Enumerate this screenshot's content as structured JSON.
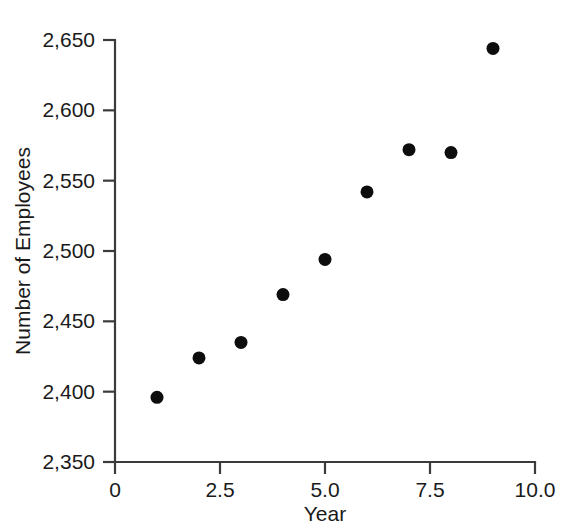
{
  "chart_data": {
    "type": "scatter",
    "title": "",
    "xlabel": "Year",
    "ylabel": "Number of Employees",
    "xlim": [
      0,
      10
    ],
    "ylim": [
      2350,
      2650
    ],
    "grid": false,
    "legend": false,
    "marker": {
      "shape": "filled-circle",
      "color": "#0d0d0d",
      "size_px": 13
    },
    "x_ticks": [
      {
        "value": 0,
        "label": "0"
      },
      {
        "value": 2.5,
        "label": "2.5"
      },
      {
        "value": 5,
        "label": "5.0"
      },
      {
        "value": 7.5,
        "label": "7.5"
      },
      {
        "value": 10,
        "label": "10.0"
      }
    ],
    "y_ticks": [
      {
        "value": 2350,
        "label": "2,350"
      },
      {
        "value": 2400,
        "label": "2,400"
      },
      {
        "value": 2450,
        "label": "2,450"
      },
      {
        "value": 2500,
        "label": "2,500"
      },
      {
        "value": 2550,
        "label": "2,550"
      },
      {
        "value": 2600,
        "label": "2,600"
      },
      {
        "value": 2650,
        "label": "2,650"
      }
    ],
    "x": [
      1,
      2,
      3,
      4,
      5,
      6,
      7,
      8,
      9
    ],
    "values": [
      2396,
      2424,
      2435,
      2469,
      2494,
      2542,
      2572,
      2570,
      2644
    ],
    "points": [
      {
        "x": 1,
        "y": 2396
      },
      {
        "x": 2,
        "y": 2424
      },
      {
        "x": 3,
        "y": 2435
      },
      {
        "x": 4,
        "y": 2469
      },
      {
        "x": 5,
        "y": 2494
      },
      {
        "x": 6,
        "y": 2542
      },
      {
        "x": 7,
        "y": 2572
      },
      {
        "x": 8,
        "y": 2570
      },
      {
        "x": 9,
        "y": 2644
      }
    ]
  },
  "colors": {
    "marker": "#0d0d0d",
    "axis": "#3b3b3b",
    "text": "#1a1a1a",
    "background": "#ffffff"
  }
}
